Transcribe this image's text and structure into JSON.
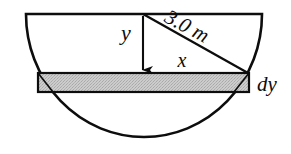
{
  "figure": {
    "type": "geometry-diagram",
    "colors": {
      "stroke": "#0d0d0d",
      "strip_fill": "#c9c9c9",
      "background": "#ffffff"
    },
    "labels": {
      "vertical_distance": "y",
      "half_chord": "x",
      "radius": "3.0 m",
      "strip_thickness": "dy"
    },
    "geometry": {
      "diameter_line": {
        "x1": 26,
        "y1": 14,
        "x2": 262,
        "y2": 14
      },
      "center": {
        "x": 143,
        "y": 14
      },
      "radius_px": 122,
      "arc_bottom": {
        "x": 143,
        "y": 137
      },
      "strip": {
        "left": 38,
        "right": 249,
        "top": 73,
        "bottom": 92
      },
      "radius_endpoint": {
        "x": 248,
        "y": 73
      },
      "arrow_tip": {
        "x": 143,
        "y": 72
      }
    },
    "label_positions": {
      "y": {
        "x": 126,
        "y": 35
      },
      "x": {
        "x": 182,
        "y": 62
      },
      "radius": {
        "x": 186,
        "y": 28,
        "rotation": 28
      },
      "dy": {
        "x": 257,
        "y": 85
      }
    }
  }
}
